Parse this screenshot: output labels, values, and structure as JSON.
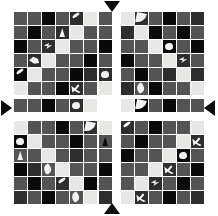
{
  "figure": {
    "canvas": {
      "width": 218,
      "height": 216,
      "background": "#ffffff"
    },
    "palette": {
      "black": "#0a0a0a",
      "dark_gray": "#2e2e2e",
      "mid_gray": "#545454",
      "light_gray": "#8c8c8c",
      "near_white": "#e8e7e4",
      "white_overlay": "#f2f1ef",
      "arrow": "#0d0d0d"
    },
    "markers": [
      {
        "name": "top-marker",
        "direction": "down",
        "x": 104,
        "y": 1
      },
      {
        "name": "bottom-marker",
        "direction": "up",
        "x": 104,
        "y": 203
      },
      {
        "name": "left-marker",
        "direction": "right",
        "x": 1,
        "y": 100
      },
      {
        "name": "right-marker",
        "direction": "left",
        "x": 204,
        "y": 100
      }
    ],
    "blocks": [
      {
        "name": "quadrant-top-left",
        "x": 14,
        "y": 12,
        "cols": 6,
        "rows": 6,
        "cell": 13,
        "cells": [
          "#545454",
          "#545454",
          "#0a0a0a",
          "#545454",
          "#2e2e2e",
          "#e8e7e4",
          "#545454",
          "#0a0a0a",
          "#545454",
          "#2e2e2e",
          "#e8e7e4",
          "#545454",
          "#0a0a0a",
          "#545454",
          "#2e2e2e",
          "#e8e7e4",
          "#545454",
          "#545454",
          "#545454",
          "#2e2e2e",
          "#e8e7e4",
          "#545454",
          "#545454",
          "#0a0a0a",
          "#0a0a0a",
          "#e8e7e4",
          "#545454",
          "#545454",
          "#0a0a0a",
          "#2e2e2e",
          "#e8e7e4",
          "#545454",
          "#545454",
          "#0a0a0a",
          "#2e2e2e",
          "#545454"
        ],
        "fragments": [
          {
            "r": 0,
            "c": 4,
            "shape": "streak",
            "tone": "light"
          },
          {
            "r": 1,
            "c": 3,
            "shape": "wedge",
            "tone": "light"
          },
          {
            "r": 2,
            "c": 2,
            "shape": "arrowlet",
            "tone": "light"
          },
          {
            "r": 3,
            "c": 1,
            "shape": "hook",
            "tone": "light"
          },
          {
            "r": 4,
            "c": 0,
            "shape": "streak",
            "tone": "light"
          },
          {
            "r": 5,
            "c": 4,
            "shape": "fork",
            "tone": "light"
          }
        ]
      },
      {
        "name": "quadrant-top-right",
        "x": 121,
        "y": 12,
        "cols": 6,
        "rows": 6,
        "cell": 13,
        "cells": [
          "#e8e7e4",
          "#2e2e2e",
          "#545454",
          "#0a0a0a",
          "#545454",
          "#2e2e2e",
          "#2e2e2e",
          "#e8e7e4",
          "#0a0a0a",
          "#545454",
          "#0a0a0a",
          "#545454",
          "#545454",
          "#545454",
          "#e8e7e4",
          "#0a0a0a",
          "#545454",
          "#0a0a0a",
          "#0a0a0a",
          "#545454",
          "#545454",
          "#e8e7e4",
          "#2e2e2e",
          "#545454",
          "#545454",
          "#0a0a0a",
          "#545454",
          "#2e2e2e",
          "#e8e7e4",
          "#2e2e2e",
          "#2e2e2e",
          "#545454",
          "#0a0a0a",
          "#545454",
          "#545454",
          "#e8e7e4"
        ],
        "fragments": [
          {
            "r": 0,
            "c": 1,
            "shape": "crescent",
            "tone": "light"
          },
          {
            "r": 2,
            "c": 3,
            "shape": "blob",
            "tone": "light"
          },
          {
            "r": 3,
            "c": 4,
            "shape": "arrowlet",
            "tone": "light"
          },
          {
            "r": 5,
            "c": 1,
            "shape": "petal",
            "tone": "light"
          }
        ]
      },
      {
        "name": "quadrant-bottom-left",
        "x": 14,
        "y": 121,
        "cols": 6,
        "rows": 6,
        "cell": 13,
        "cells": [
          "#e8e7e4",
          "#545454",
          "#545454",
          "#0a0a0a",
          "#545454",
          "#2e2e2e",
          "#0a0a0a",
          "#e8e7e4",
          "#545454",
          "#545454",
          "#0a0a0a",
          "#545454",
          "#545454",
          "#545454",
          "#e8e7e4",
          "#545454",
          "#2e2e2e",
          "#545454",
          "#0a0a0a",
          "#2e2e2e",
          "#545454",
          "#e8e7e4",
          "#545454",
          "#545454",
          "#545454",
          "#0a0a0a",
          "#545454",
          "#2e2e2e",
          "#e8e7e4",
          "#0a0a0a",
          "#2e2e2e",
          "#545454",
          "#0a0a0a",
          "#545454",
          "#545454",
          "#e8e7e4"
        ],
        "fragments": [
          {
            "r": 0,
            "c": 5,
            "shape": "crescent",
            "tone": "light"
          },
          {
            "r": 1,
            "c": 0,
            "shape": "blob",
            "tone": "light"
          },
          {
            "r": 2,
            "c": 0,
            "shape": "wedge",
            "tone": "light"
          },
          {
            "r": 3,
            "c": 2,
            "shape": "petal",
            "tone": "light"
          },
          {
            "r": 4,
            "c": 3,
            "shape": "streak",
            "tone": "light"
          },
          {
            "r": 5,
            "c": 4,
            "shape": "petal",
            "tone": "light"
          }
        ]
      },
      {
        "name": "quadrant-bottom-right",
        "x": 121,
        "y": 121,
        "cols": 6,
        "rows": 6,
        "cell": 13,
        "cells": [
          "#2e2e2e",
          "#545454",
          "#0a0a0a",
          "#545454",
          "#545454",
          "#e8e7e4",
          "#545454",
          "#0a0a0a",
          "#545454",
          "#545454",
          "#e8e7e4",
          "#2e2e2e",
          "#0a0a0a",
          "#545454",
          "#545454",
          "#e8e7e4",
          "#0a0a0a",
          "#545454",
          "#545454",
          "#545454",
          "#e8e7e4",
          "#2e2e2e",
          "#545454",
          "#0a0a0a",
          "#545454",
          "#e8e7e4",
          "#2e2e2e",
          "#545454",
          "#0a0a0a",
          "#545454",
          "#e8e7e4",
          "#2e2e2e",
          "#545454",
          "#0a0a0a",
          "#545454",
          "#2e2e2e"
        ],
        "fragments": [
          {
            "r": 0,
            "c": 0,
            "shape": "streak",
            "tone": "light"
          },
          {
            "r": 1,
            "c": 5,
            "shape": "fork",
            "tone": "light"
          },
          {
            "r": 2,
            "c": 4,
            "shape": "blob",
            "tone": "light"
          },
          {
            "r": 3,
            "c": 3,
            "shape": "fork",
            "tone": "light"
          },
          {
            "r": 4,
            "c": 2,
            "shape": "arrowlet",
            "tone": "light"
          },
          {
            "r": 5,
            "c": 1,
            "shape": "fork",
            "tone": "light"
          }
        ]
      },
      {
        "name": "separator-strip-vertical-top",
        "x": 99,
        "y": 12,
        "cols": 1,
        "rows": 6,
        "cell": 13,
        "cells": [
          "#545454",
          "#545454",
          "#0a0a0a",
          "#545454",
          "#2e2e2e",
          "#e8e7e4"
        ],
        "fragments": [
          {
            "r": 4,
            "c": 0,
            "shape": "blob",
            "tone": "light"
          }
        ]
      },
      {
        "name": "separator-strip-vertical-bottom",
        "x": 99,
        "y": 121,
        "cols": 1,
        "rows": 6,
        "cell": 13,
        "cells": [
          "#e8e7e4",
          "#545454",
          "#545454",
          "#0a0a0a",
          "#545454",
          "#2e2e2e"
        ],
        "fragments": [
          {
            "r": 1,
            "c": 0,
            "shape": "wedge",
            "tone": "dark"
          }
        ]
      },
      {
        "name": "separator-strip-horizontal-left",
        "x": 14,
        "y": 99,
        "cols": 6,
        "rows": 1,
        "cell": 13,
        "cells": [
          "#545454",
          "#545454",
          "#0a0a0a",
          "#545454",
          "#2e2e2e",
          "#e8e7e4"
        ],
        "fragments": [
          {
            "r": 0,
            "c": 4,
            "shape": "blob",
            "tone": "light"
          }
        ]
      },
      {
        "name": "separator-strip-horizontal-right",
        "x": 121,
        "y": 99,
        "cols": 6,
        "rows": 1,
        "cell": 13,
        "cells": [
          "#e8e7e4",
          "#0a0a0a",
          "#545454",
          "#0a0a0a",
          "#545454",
          "#545454"
        ],
        "fragments": [
          {
            "r": 0,
            "c": 1,
            "shape": "crescent",
            "tone": "light"
          }
        ]
      }
    ]
  }
}
